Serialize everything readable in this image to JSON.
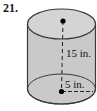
{
  "problem": {
    "number": "21."
  },
  "figure": {
    "type": "cylinder-diagram",
    "height_label": "15 in.",
    "radius_label": "5 in.",
    "colors": {
      "body_fill": "#c9c9c9",
      "top_fill": "#d4d4d4",
      "outline": "#3a3a3a",
      "line": "#222222",
      "dot": "#000000",
      "background": "#ffffff"
    }
  }
}
